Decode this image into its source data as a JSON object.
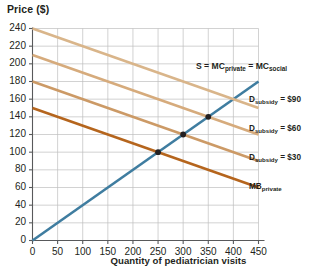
{
  "chart_data": {
    "type": "line",
    "title": "",
    "xlabel": "Quantity of pediatrician visits",
    "ylabel": "Price ($)",
    "xlim": [
      0,
      450
    ],
    "ylim": [
      0,
      240
    ],
    "grid": true,
    "legend_position": "right-inline",
    "x_ticks": [
      0,
      50,
      100,
      150,
      200,
      250,
      300,
      350,
      400,
      450
    ],
    "y_ticks": [
      0,
      20,
      40,
      60,
      80,
      100,
      120,
      140,
      160,
      180,
      200,
      220,
      240
    ],
    "series": [
      {
        "name": "S = MC_private = MC_social",
        "label_html": "S = MC<sub>private</sub> = MC<sub>social</sub>",
        "color": "#3f7da0",
        "x": [
          0,
          450
        ],
        "values": [
          0,
          180
        ]
      },
      {
        "name": "D_subsidy = $90",
        "label_html": "D<sub>subsidy</sub> = $90",
        "color": "#d9b58a",
        "x": [
          0,
          450
        ],
        "values": [
          240,
          150
        ]
      },
      {
        "name": "D_subsidy = $60",
        "label_html": "D<sub>subsidy</sub> = $60",
        "color": "#d6ab7c",
        "x": [
          0,
          450
        ],
        "values": [
          210,
          120
        ]
      },
      {
        "name": "D_subsidy = $30",
        "label_html": "D<sub>subsidy</sub> = $30",
        "color": "#cc9a66",
        "x": [
          0,
          450
        ],
        "values": [
          180,
          90
        ]
      },
      {
        "name": "MB_private",
        "label_html": "MB<sub>private</sub>",
        "color": "#b5651d",
        "x": [
          0,
          450
        ],
        "values": [
          150,
          60
        ]
      }
    ],
    "points": [
      {
        "x": 250,
        "y": 100
      },
      {
        "x": 300,
        "y": 120
      },
      {
        "x": 350,
        "y": 140
      }
    ],
    "annotations": [
      {
        "text": "S = MC_private = MC_social",
        "x": 300,
        "y": 200
      },
      {
        "text": "D_subsidy = $90",
        "x": 450,
        "y": 150
      },
      {
        "text": "D_subsidy = $60",
        "x": 450,
        "y": 120
      },
      {
        "text": "D_subsidy = $30",
        "x": 450,
        "y": 90
      },
      {
        "text": "MB_private",
        "x": 450,
        "y": 60
      }
    ]
  },
  "axes": {
    "y_title": "Price ($)",
    "x_title": "Quantity of pediatrician visits",
    "y_tick_labels": [
      "240",
      "220",
      "200",
      "180",
      "160",
      "140",
      "120",
      "100",
      "80",
      "60",
      "40",
      "20",
      "0"
    ],
    "x_tick_labels": [
      "0",
      "50",
      "100",
      "150",
      "200",
      "250",
      "300",
      "350",
      "400",
      "450"
    ]
  },
  "series_labels": {
    "supply": "S = MC",
    "supply_sub1": "private",
    "supply_mid": " = MC",
    "supply_sub2": "social",
    "d90_prefix": "D",
    "d90_sub": "subsidy",
    "d90_value": " = $90",
    "d60_prefix": "D",
    "d60_sub": "subsidy",
    "d60_value": " = $60",
    "d30_prefix": "D",
    "d30_sub": "subsidy",
    "d30_value": " = $30",
    "mbp_prefix": "MB",
    "mbp_sub": "private"
  },
  "colors": {
    "supply_line": "#3f7da0",
    "d90_line": "#d9b58a",
    "d60_line": "#d6ab7c",
    "d30_line": "#cc9a66",
    "mbprivate_line": "#b5651d",
    "grid": "#bfbfbf",
    "axis": "#58595b",
    "point": "#231f20",
    "text": "#231f20",
    "background": "#ffffff"
  }
}
